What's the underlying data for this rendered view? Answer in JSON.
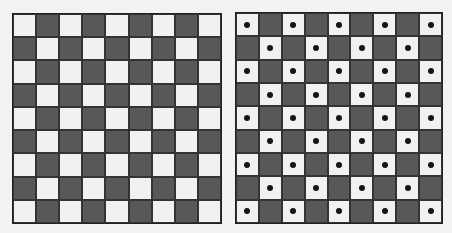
{
  "boards": [
    {
      "id": "plain-checkerboard",
      "rows": 9,
      "cols": 9,
      "corner": "light",
      "dots_on_light": false
    },
    {
      "id": "dotted-checkerboard",
      "rows": 9,
      "cols": 9,
      "corner": "light",
      "dots_on_light": true
    }
  ],
  "colors": {
    "light": "#f1f1f1",
    "dark": "#585858",
    "border": "#222222",
    "dot": "#151515"
  }
}
